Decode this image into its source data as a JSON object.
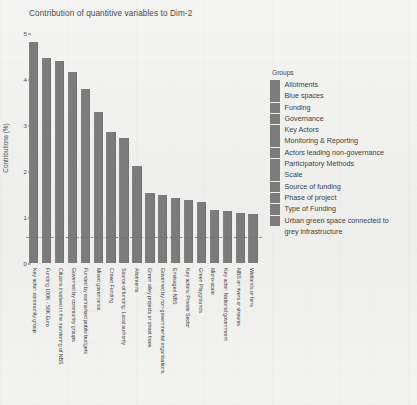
{
  "chart_data": {
    "type": "bar",
    "title": "Contribution of quantitive variables to Dim-2",
    "xlabel": "",
    "ylabel": "Contributions (%)",
    "ylim": [
      0,
      5
    ],
    "yticks": [
      "0",
      "1",
      "2",
      "3",
      "4",
      "5"
    ],
    "grid": false,
    "reference_line": 0.55,
    "bar_color": "#7b7b7b",
    "categories": [
      "Key actor: community group",
      "Funding 100K - 50K Euro",
      "Citizens involved in the monitoring of NBS",
      "Governed by community groups",
      "Funded by earmarked public budgets",
      "Mixed governance",
      "Crowd Funding",
      "Source of funding: Local authority",
      "Allotments",
      "Green alley projects or street trees",
      "Governed by non-governmental organisations",
      "Envisaged NBS",
      "Key actors: Private Sector",
      "Green Playgrounds",
      "Micro-scale",
      "Key actor: National government",
      "NBS on rivers or streams",
      "Wetlands or fens"
    ],
    "values": [
      4.8,
      4.45,
      4.4,
      4.15,
      3.78,
      3.28,
      2.85,
      2.72,
      2.1,
      1.52,
      1.48,
      1.42,
      1.38,
      1.32,
      1.15,
      1.12,
      1.08,
      1.06
    ],
    "legend": {
      "position": "right",
      "title": "Groups",
      "entries": [
        "Allotments",
        "Blue spaces",
        "Funding",
        "Governance",
        "Key Actors",
        "Monitoring & Reporting",
        "Actors leading non-governance",
        "Participatory Methods",
        "Scale",
        "Source of funding",
        "Phase of project",
        "Type of Funding",
        "Urban green space connected to"
      ],
      "last_entry_continuation": "grey infrastructure"
    }
  }
}
